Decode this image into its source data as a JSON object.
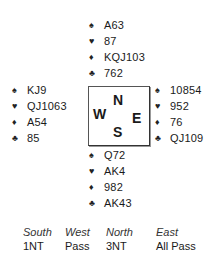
{
  "hands": {
    "north": {
      "spades": "A63",
      "hearts": "87",
      "diamonds": "KQJ103",
      "clubs": "762"
    },
    "west": {
      "spades": "KJ9",
      "hearts": "QJ1063",
      "diamonds": "A54",
      "clubs": "85"
    },
    "east": {
      "spades": "10854",
      "hearts": "952",
      "diamonds": "76",
      "clubs": "QJ109"
    },
    "south": {
      "spades": "Q72",
      "hearts": "AK4",
      "diamonds": "982",
      "clubs": "AK43"
    }
  },
  "suit_symbols": {
    "spades": "♠",
    "hearts": "♥",
    "diamonds": "♦",
    "clubs": "♣"
  },
  "compass": {
    "n": "N",
    "w": "W",
    "e": "E",
    "s": "S"
  },
  "bidding": {
    "headers": [
      "South",
      "West",
      "North",
      "East"
    ],
    "bids": [
      "1NT",
      "Pass",
      "3NT",
      "All Pass"
    ]
  }
}
